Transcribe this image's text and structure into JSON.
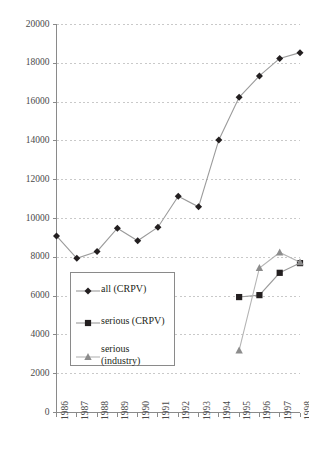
{
  "chart_data": {
    "type": "line",
    "title": "",
    "xlabel": "",
    "ylabel": "",
    "x": [
      1986,
      1987,
      1988,
      1989,
      1990,
      1991,
      1992,
      1993,
      1994,
      1995,
      1996,
      1997,
      1998
    ],
    "categories": [
      "1986",
      "1987",
      "1988",
      "1989",
      "1990",
      "1991",
      "1992",
      "1993",
      "1994",
      "1995",
      "1996",
      "1997",
      "1998"
    ],
    "ylim": [
      0,
      20000
    ],
    "yticks": [
      0,
      2000,
      4000,
      6000,
      8000,
      10000,
      12000,
      14000,
      16000,
      18000,
      20000
    ],
    "ytick_labels": [
      "0",
      "2000",
      "4000",
      "6000",
      "8000",
      "10000",
      "12000",
      "14000",
      "16000",
      "18000",
      "20000"
    ],
    "grid": true,
    "grid_style": "dashed-horizontal",
    "legend_position": "inside-lower-left",
    "series": [
      {
        "name": "all (CRPV)",
        "marker": "diamond",
        "color": "#231f20",
        "line_color": "#9b9b9b",
        "x": [
          1986,
          1987,
          1988,
          1989,
          1990,
          1991,
          1992,
          1993,
          1994,
          1995,
          1996,
          1997,
          1998
        ],
        "values": [
          9100,
          7950,
          8300,
          9500,
          8850,
          9550,
          11150,
          10600,
          14050,
          16250,
          17350,
          18250,
          18550
        ]
      },
      {
        "name": "serious (CRPV)",
        "marker": "square",
        "color": "#231f20",
        "line_color": "#9b9b9b",
        "x": [
          1995,
          1996,
          1997,
          1998
        ],
        "values": [
          5950,
          6050,
          7200,
          7700
        ]
      },
      {
        "name": "serious (industry)",
        "marker": "triangle",
        "color": "#8c8c8c",
        "line_color": "#b4b4b4",
        "x": [
          1995,
          1996,
          1997,
          1998
        ],
        "values": [
          3200,
          7450,
          8250,
          7750
        ]
      }
    ]
  },
  "legend": {
    "entries": [
      {
        "label": "all (CRPV)",
        "label2": "",
        "marker": "diamond"
      },
      {
        "label": "serious (CRPV)",
        "label2": "",
        "marker": "square"
      },
      {
        "label": "serious",
        "label2": "(industry)",
        "marker": "triangle"
      }
    ]
  },
  "colors": {
    "axis": "#8a8a8a",
    "grid": "#c9c9c9",
    "tick_text": "#4a4a4a",
    "label_text": "#231f20",
    "series_dark": "#231f20",
    "series_gray": "#8c8c8c",
    "line_gray": "#9b9b9b",
    "background": "#ffffff"
  }
}
